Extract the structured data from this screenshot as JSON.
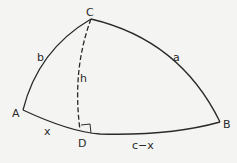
{
  "diagram": {
    "type": "spherical-triangle",
    "vertices": {
      "A": {
        "label": "A"
      },
      "B": {
        "label": "B"
      },
      "C": {
        "label": "C"
      },
      "D": {
        "label": "D"
      }
    },
    "sides": {
      "a": "a",
      "b": "b",
      "h": "h",
      "x": "x",
      "cx": "c−x"
    },
    "stroke_color": "#2a2a2a",
    "background": "#f4f4f2"
  }
}
